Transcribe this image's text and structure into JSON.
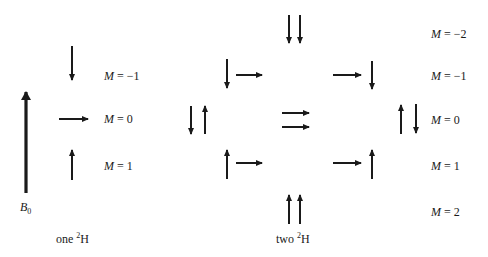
{
  "diagram": {
    "field_label": {
      "symbol": "B",
      "subscript": "0"
    },
    "one_deuteron": {
      "label_prefix": "one",
      "isotope_mass": "2",
      "isotope_symbol": "H",
      "states": [
        {
          "M": "−1",
          "spin": "down"
        },
        {
          "M": "0",
          "spin": "right"
        },
        {
          "M": "1",
          "spin": "up"
        }
      ]
    },
    "two_deuterons": {
      "label_prefix": "two",
      "isotope_mass": "2",
      "isotope_symbol": "H",
      "states": [
        {
          "M": "−2",
          "spins": [
            "down",
            "down"
          ]
        },
        {
          "M": "−1",
          "spins": [
            "down",
            "right"
          ]
        },
        {
          "M": "0",
          "spins": [
            "down",
            "up",
            "right",
            "right",
            "up",
            "down"
          ]
        },
        {
          "M": "1",
          "spins": [
            "up",
            "right"
          ]
        },
        {
          "M": "2",
          "spins": [
            "up",
            "up"
          ]
        }
      ]
    },
    "m_symbol": "M",
    "equals": "=",
    "colors": {
      "ink": "#1a1a1a",
      "background": "#ffffff"
    }
  }
}
